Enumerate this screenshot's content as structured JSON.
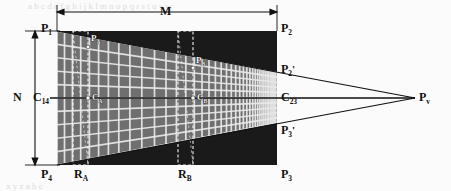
{
  "figure": {
    "colors": {
      "background": "#fbfbfb",
      "rectangle_fill": "#1a1a1a",
      "grid_fill": "#6e6e6e",
      "grid_line": "#e8e8e8",
      "dashed_line": "#f0f0f0",
      "line": "#111111",
      "label": "#0d0d0d"
    },
    "labels": {
      "M": "M",
      "N": "N",
      "P1": "P",
      "P1_sub": "1",
      "P2": "P",
      "P2_sub": "2",
      "P3": "P",
      "P3_sub": "3",
      "P4": "P",
      "P4_sub": "4",
      "P2p": "P",
      "P2p_sub": "2",
      "P2p_prime": "'",
      "P3p": "P",
      "P3p_sub": "3",
      "P3p_prime": "'",
      "Pv": "P",
      "Pv_sub": "v",
      "PA": "P",
      "PA_sub": "A",
      "PB": "P",
      "PB_sub": "B",
      "C14": "C",
      "C14_sub": "14",
      "C23": "C",
      "C23_sub": "23",
      "CA": "C",
      "CA_sub": "A",
      "CB": "C",
      "CB_sub": "B",
      "RA": "R",
      "RA_sub": "A",
      "RB": "R",
      "RB_sub": "B"
    },
    "geometry": {
      "rect": {
        "x": 57,
        "y": 31,
        "width": 220,
        "height": 134
      },
      "trapezoid": {
        "left_x": 57,
        "left_top_y": 31,
        "left_bottom_y": 165,
        "right_x": 277,
        "right_top_y": 72,
        "right_bottom_y": 123
      },
      "vanishing_point": {
        "x": 415,
        "y": 98
      },
      "center_line_y": 98,
      "region_A": {
        "x": 73,
        "width": 15
      },
      "region_B": {
        "x": 178,
        "width": 15
      },
      "dimension_M": {
        "x1": 57,
        "x2": 277,
        "y": 12
      },
      "dimension_N": {
        "x": 35,
        "y1": 31,
        "y2": 165
      }
    }
  }
}
